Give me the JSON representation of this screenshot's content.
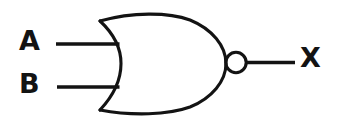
{
  "diagram": {
    "type": "logic-gate-schematic",
    "gate": {
      "kind": "NOR",
      "symbol_style": "distinctive-shape",
      "has_inversion_bubble": true,
      "inputs_count": 2,
      "outputs_count": 1
    },
    "colors": {
      "background": "#ffffff",
      "stroke": "#131313",
      "label": "#131313"
    },
    "labels": {
      "input_a": "A",
      "input_b": "B",
      "output_x": "X"
    },
    "terminals": [
      {
        "name": "input-a",
        "label": "A",
        "role": "input"
      },
      {
        "name": "input-b",
        "label": "B",
        "role": "input"
      },
      {
        "name": "output-x",
        "label": "X",
        "role": "output"
      }
    ]
  }
}
